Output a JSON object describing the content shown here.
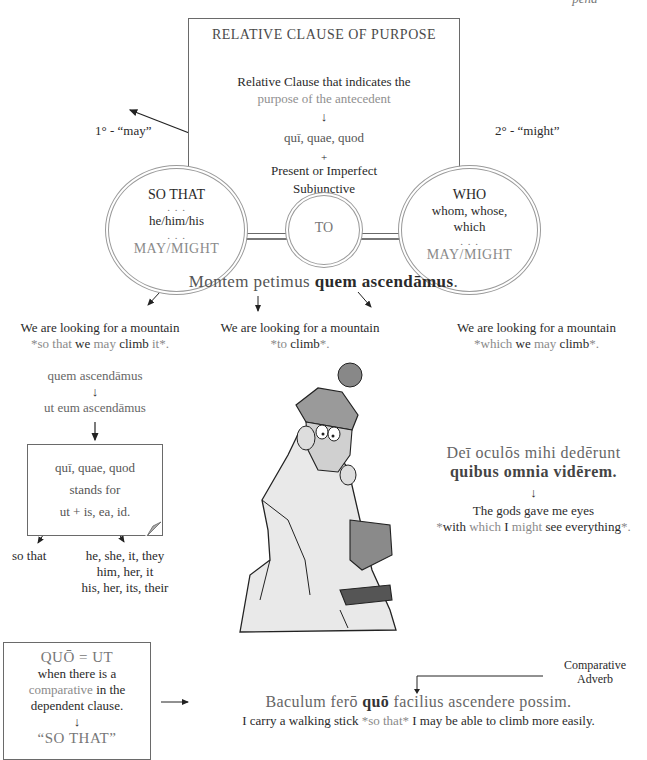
{
  "page_fragment": "-pend-",
  "main_box": {
    "title": "RELATIVE CLAUSE OF PURPOSE",
    "line1": "Relative Clause that indicates the",
    "line2": "purpose of the antecedent",
    "arrow": "↓",
    "line3": "quī, quae, quod",
    "plus": "+",
    "line4": "Present or Imperfect",
    "line5": "Subjunctive"
  },
  "side_labels": {
    "left": "1° - “may”",
    "right": "2° - “might”"
  },
  "circles": {
    "left": {
      "title": "SO THAT",
      "dots1": ". . .",
      "pronouns": "he/him/his",
      "dots2": ". . .",
      "modal": "MAY/MIGHT"
    },
    "middle": {
      "title": "TO"
    },
    "right": {
      "title": "WHO",
      "line1": "whom, whose,",
      "line2": "which",
      "dots": ". . .",
      "modal": "MAY/MIGHT"
    }
  },
  "example1": {
    "latin_plain": "Montem petimus ",
    "latin_bold": "quem ascendāmus",
    "latin_end": ".",
    "translations": [
      {
        "line1": "We are looking for a mountain",
        "star": "*",
        "p1": "so that",
        "p2": " we ",
        "p3": "may",
        "p4": " climb ",
        "p5": "it",
        "end": "*."
      },
      {
        "line1": "We are looking for a mountain",
        "star": "*",
        "p1": "to",
        "p2": " climb",
        "end": "*."
      },
      {
        "line1": "We are looking for a mountain",
        "star": "*",
        "p1": "which",
        "p2": " we ",
        "p3": "may",
        "p4": " climb",
        "end": "*."
      }
    ]
  },
  "derivation": {
    "line1": "quem ascendāmus",
    "arrow1": "↓",
    "line2": "ut eum ascendāmus",
    "arrow2": "↓"
  },
  "note_box": {
    "line1": "quī, quae, quod",
    "line2": "stands for",
    "line3": "ut + is, ea, id.",
    "left_meaning": "so that",
    "right_meaning": [
      "he, she, it, they",
      "him, her, it",
      "his, her, its, their"
    ]
  },
  "example2": {
    "latin1": "Deī oculōs mihi dedērunt",
    "latin2": "quibus omnia vidērem.",
    "arrow": "↓",
    "eng1": "The gods gave me eyes",
    "star": "*",
    "p1": "with ",
    "p2": "which",
    "p3": " I ",
    "p4": "might",
    "p5": " see everything",
    "end": "*."
  },
  "quo_box": {
    "title": "QUŌ = UT",
    "line1": "when there is a",
    "line2a": "comparative",
    "line2b": " in the",
    "line3": "dependent clause.",
    "arrow": "↓",
    "line4": "“SO THAT”"
  },
  "example3": {
    "annotation1": "Comparative",
    "annotation2": "Adverb",
    "latin_a": "Baculum ferō ",
    "latin_bold": "quō",
    "latin_b": " facilius ascendere possim.",
    "eng_a": "I carry a walking stick ",
    "star": "*",
    "eng_grey": "so that",
    "eng_b": " I may be able to climb more easily."
  },
  "illustration": {
    "description": "cartoon man in knit hat clinging to a rocky mountain peak"
  }
}
